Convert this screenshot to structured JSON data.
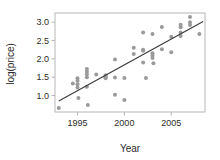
{
  "chart_data": {
    "type": "scatter",
    "title": "",
    "xlabel": "Year",
    "ylabel": "log(price)",
    "xlim": [
      1992.6,
      2008.6
    ],
    "ylim": [
      0.55,
      3.25
    ],
    "xticks": [
      1995,
      2000,
      2005
    ],
    "xtick_labels": [
      "1995",
      "2000",
      "2005"
    ],
    "yticks": [
      1.0,
      1.5,
      2.0,
      2.5,
      3.0
    ],
    "ytick_labels": [
      "1.0",
      "1.5",
      "2.0",
      "2.5",
      "3.0"
    ],
    "grid": false,
    "legend": null,
    "point_color": "#9a9a9a",
    "line_color": "#3a3a3a",
    "frame_color": "#b0b0b0",
    "background": "#ffffff",
    "series": [
      {
        "name": "observations",
        "type": "scatter",
        "marker": "circle",
        "color": "#9a9a9a",
        "points": [
          [
            1993.0,
            0.66
          ],
          [
            1994.5,
            1.33
          ],
          [
            1995.0,
            1.47
          ],
          [
            1995.0,
            1.4
          ],
          [
            1995.0,
            1.31
          ],
          [
            1995.0,
            1.22
          ],
          [
            1995.1,
            0.93
          ],
          [
            1996.0,
            1.72
          ],
          [
            1996.0,
            1.65
          ],
          [
            1996.0,
            1.58
          ],
          [
            1996.0,
            1.5
          ],
          [
            1996.0,
            1.24
          ],
          [
            1996.1,
            0.74
          ],
          [
            1997.0,
            1.57
          ],
          [
            1998.0,
            1.55
          ],
          [
            1998.0,
            1.5
          ],
          [
            1998.0,
            1.47
          ],
          [
            1999.0,
            1.98
          ],
          [
            1999.0,
            1.49
          ],
          [
            1999.0,
            1.02
          ],
          [
            2000.0,
            1.48
          ],
          [
            2000.0,
            0.88
          ],
          [
            2001.0,
            2.3
          ],
          [
            2001.0,
            2.13
          ],
          [
            2002.0,
            2.72
          ],
          [
            2002.0,
            2.25
          ],
          [
            2002.0,
            2.22
          ],
          [
            2002.0,
            1.9
          ],
          [
            2002.3,
            1.48
          ],
          [
            2003.0,
            2.68
          ],
          [
            2003.0,
            2.15
          ],
          [
            2003.0,
            2.09
          ],
          [
            2003.0,
            2.02
          ],
          [
            2003.1,
            1.88
          ],
          [
            2004.0,
            2.87
          ],
          [
            2004.0,
            2.26
          ],
          [
            2005.0,
            2.6
          ],
          [
            2005.0,
            2.18
          ],
          [
            2006.0,
            2.93
          ],
          [
            2006.0,
            2.86
          ],
          [
            2006.0,
            2.72
          ],
          [
            2006.0,
            2.62
          ],
          [
            2007.0,
            3.14
          ],
          [
            2007.0,
            3.0
          ],
          [
            2007.0,
            2.92
          ],
          [
            2008.0,
            2.68
          ]
        ]
      },
      {
        "name": "fitted regression line",
        "type": "line",
        "color": "#3a3a3a",
        "endpoints": [
          [
            1993.0,
            0.85
          ],
          [
            2008.4,
            3.02
          ]
        ]
      }
    ]
  }
}
